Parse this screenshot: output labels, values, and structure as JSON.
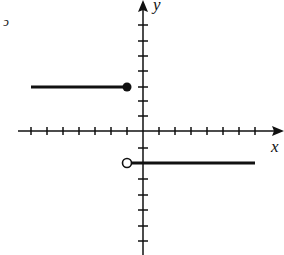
{
  "graph": {
    "x_axis_label": "x",
    "y_axis_label": "y",
    "stray_mark": "ↄ",
    "colors": {
      "ink": "#111111",
      "background": "#ffffff"
    },
    "origin_px": [
      143,
      131
    ],
    "unit_px": 16,
    "x_ticks": [
      -7,
      -6,
      -5,
      -4,
      -3,
      -2,
      -1,
      1,
      2,
      3,
      4,
      5,
      6,
      7
    ],
    "y_ticks": [
      7,
      6,
      5,
      4,
      3,
      2,
      1,
      -1,
      -2,
      -3,
      -4,
      -5,
      -6,
      -7
    ],
    "segments": [
      {
        "from": [
          -7,
          3
        ],
        "to": [
          -1,
          3
        ],
        "left_end": "none",
        "right_end": "closed"
      },
      {
        "from": [
          -1,
          -2
        ],
        "to": [
          7,
          -2
        ],
        "left_end": "open",
        "right_end": "none"
      }
    ]
  }
}
